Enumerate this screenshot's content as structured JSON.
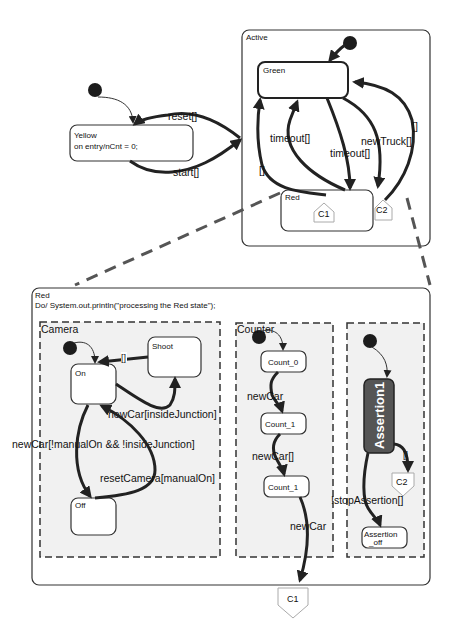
{
  "diagram": {
    "top": {
      "yellow": {
        "name": "Yellow",
        "entry": "on entry/nCnt = 0;"
      },
      "transitions": {
        "reset": "reset[]",
        "start": "start[]"
      },
      "active": {
        "title": "Active",
        "green": "Green",
        "red": "Red",
        "connectors": [
          "C1",
          "C2"
        ],
        "transitions": {
          "timeout_up": "timeout[]",
          "timeout_down": "timeout[]",
          "newtruck": "newTruck[]",
          "empty_left": "[]",
          "empty_right": "[]"
        }
      }
    },
    "red_detail": {
      "title": "Red",
      "action": "Do/ System.out.println(\"processing the Red state\");",
      "camera": {
        "title": "Camera",
        "states": [
          "On",
          "Shoot",
          "Off"
        ],
        "transitions": {
          "shoot_to_on": "[]",
          "new_car_inside": "newCar[insideJunction]",
          "new_car_manual": "newCar[!manualOn && !insideJunction]",
          "reset_camera": "resetCamera[manualOn]"
        }
      },
      "counter": {
        "title": "Counter",
        "states": [
          "Count_0",
          "Count_1",
          "Count_1"
        ],
        "transitions": [
          "newCar",
          "newCar[]",
          "newCar"
        ]
      },
      "assertion": {
        "states": [
          "Assertion1",
          "Assertion",
          "_off"
        ],
        "transitions": {
          "to_c2": "[]",
          "stop": "!stopAssertion[]"
        },
        "connector": "C2"
      },
      "exit_connector": "C1"
    },
    "colors": {
      "stroke": "#222222",
      "region_fill": "#f1f1f1",
      "assertion_fill": "#555555"
    }
  }
}
